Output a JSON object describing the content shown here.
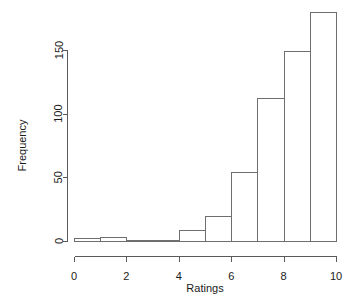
{
  "chart_data": {
    "type": "bar",
    "title": "",
    "subtitle": "",
    "xlabel": "Ratings",
    "ylabel": "Frequency",
    "grid": false,
    "legend": false,
    "legend_position": "none",
    "bin_width": 1,
    "bin_edges": [
      0,
      1,
      2,
      3,
      4,
      5,
      6,
      7,
      8,
      9,
      10
    ],
    "categories": [
      "0-1",
      "1-2",
      "2-3",
      "3-4",
      "4-5",
      "5-6",
      "6-7",
      "7-8",
      "8-9",
      "9-10"
    ],
    "values": [
      2,
      3,
      1,
      1,
      9,
      20,
      54,
      112,
      149,
      180
    ],
    "xlim": [
      0,
      10
    ],
    "ylim": [
      0,
      180
    ],
    "xticks": [
      0,
      2,
      4,
      6,
      8,
      10
    ],
    "xtick_labels": [
      "0",
      "2",
      "4",
      "6",
      "8",
      "10"
    ],
    "yticks": [
      0,
      50,
      100,
      150
    ],
    "ytick_labels": [
      "0",
      "50",
      "100",
      "150"
    ],
    "bar_stroke_color": "#6e6e6e",
    "bar_fill_color": "none",
    "axis_color": "#5a5a5a",
    "background_color": "#ffffff"
  }
}
